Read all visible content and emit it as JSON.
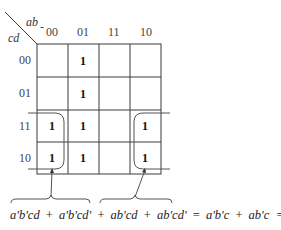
{
  "kmap": {
    "col_variable": "ab",
    "row_variable": "cd",
    "col_headers": [
      "00",
      "01",
      "11",
      "10"
    ],
    "row_headers": [
      "00",
      "01",
      "11",
      "10"
    ],
    "cells": [
      [
        "",
        "1",
        "",
        ""
      ],
      [
        "",
        "1",
        "",
        ""
      ],
      [
        "1",
        "1",
        "",
        "1"
      ],
      [
        "1",
        "1",
        "",
        "1"
      ]
    ],
    "groups": [
      {
        "name": "left-wrap-group",
        "cells": "col 00, rows 11-10"
      },
      {
        "name": "right-wrap-group",
        "cells": "col 10, rows 11-10"
      }
    ]
  },
  "equation": {
    "term1": "a'b'cd",
    "plus1": "+",
    "term2": "a'b'cd'",
    "plus2": "+",
    "term3": "ab'cd",
    "plus3": "+",
    "term4": "ab'cd'",
    "eq1": "=",
    "term5": "a'b'c",
    "plus4": "+",
    "term6": "ab'c",
    "eq2": "=",
    "result": "b'c"
  },
  "colors": {
    "line": "#3a3a3a",
    "text": "#222222",
    "background": "#ffffff"
  }
}
